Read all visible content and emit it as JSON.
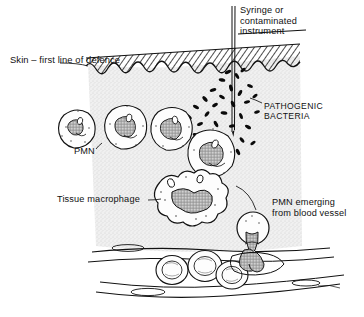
{
  "figure": {
    "domain": "biology-illustration",
    "title_visible": false,
    "background_color": "#ffffff",
    "ink_color": "#111111",
    "tissue_fill": "#ededed",
    "skin_hatch_color": "#1a1a1a"
  },
  "labels": {
    "syringe": "Syringe or\ncontaminated\ninstrument",
    "skin": "Skin – first line of defence",
    "bacteria": "PATHOGENIC\nBACTERIA",
    "pmn": "PMN",
    "macrophage": "Tissue macrophage",
    "pmn_emerging": "PMN emerging\nfrom blood vessel"
  },
  "structures": {
    "skin_layer": "hatched-epidermis-wedge",
    "dermis": "stippled-connective-tissue",
    "needle": "vertical-syringe-needle",
    "blood_vessel": "horizontal-capillary",
    "bacteria_count": 34,
    "pmn_count": 4,
    "rbc_count": 3,
    "macrophage_count": 1,
    "diapedesis_count": 1
  }
}
